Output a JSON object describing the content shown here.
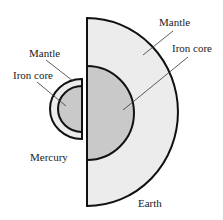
{
  "diagram": {
    "colors": {
      "mantle": "#ececec",
      "core": "#c9c9c9",
      "outline": "#111111"
    },
    "mercury": {
      "name": "Mercury",
      "mantle_label": "Mantle",
      "core_label": "Iron core"
    },
    "earth": {
      "name": "Earth",
      "mantle_label": "Mantle",
      "core_label": "Iron core"
    }
  }
}
